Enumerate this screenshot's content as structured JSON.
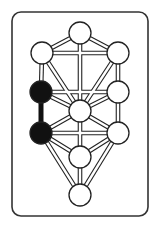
{
  "diagram": {
    "frame": {
      "x": 12,
      "y": 12,
      "w": 136,
      "h": 204,
      "rx": 9,
      "stroke": "#333333"
    },
    "colors": {
      "line": "#222222",
      "fill_empty": "#ffffff",
      "fill_highlight": "#111111",
      "background": "#ffffff"
    },
    "node_radius": 11,
    "nodes": [
      {
        "id": "n1",
        "x": 80,
        "y": 33,
        "highlighted": false
      },
      {
        "id": "n2",
        "x": 118,
        "y": 53,
        "highlighted": false
      },
      {
        "id": "n3",
        "x": 42,
        "y": 53,
        "highlighted": false
      },
      {
        "id": "n4",
        "x": 118,
        "y": 92,
        "highlighted": false
      },
      {
        "id": "n5",
        "x": 41,
        "y": 92,
        "highlighted": true
      },
      {
        "id": "n6",
        "x": 80,
        "y": 111,
        "highlighted": false
      },
      {
        "id": "n7",
        "x": 118,
        "y": 133,
        "highlighted": false
      },
      {
        "id": "n8",
        "x": 41,
        "y": 133,
        "highlighted": true
      },
      {
        "id": "n9",
        "x": 80,
        "y": 157,
        "highlighted": false
      },
      {
        "id": "n10",
        "x": 80,
        "y": 195,
        "highlighted": false
      }
    ],
    "paths": [
      {
        "from": "n1",
        "to": "n2",
        "highlighted": false
      },
      {
        "from": "n1",
        "to": "n3",
        "highlighted": false
      },
      {
        "from": "n1",
        "to": "n6",
        "highlighted": false
      },
      {
        "from": "n2",
        "to": "n3",
        "highlighted": false
      },
      {
        "from": "n2",
        "to": "n4",
        "highlighted": false
      },
      {
        "from": "n2",
        "to": "n6",
        "highlighted": false
      },
      {
        "from": "n3",
        "to": "n5",
        "highlighted": false
      },
      {
        "from": "n3",
        "to": "n6",
        "highlighted": false
      },
      {
        "from": "n4",
        "to": "n5",
        "highlighted": false
      },
      {
        "from": "n4",
        "to": "n6",
        "highlighted": false
      },
      {
        "from": "n4",
        "to": "n7",
        "highlighted": false
      },
      {
        "from": "n5",
        "to": "n6",
        "highlighted": false
      },
      {
        "from": "n5",
        "to": "n8",
        "highlighted": true
      },
      {
        "from": "n6",
        "to": "n7",
        "highlighted": false
      },
      {
        "from": "n6",
        "to": "n8",
        "highlighted": false
      },
      {
        "from": "n6",
        "to": "n9",
        "highlighted": false
      },
      {
        "from": "n7",
        "to": "n8",
        "highlighted": false
      },
      {
        "from": "n7",
        "to": "n9",
        "highlighted": false
      },
      {
        "from": "n7",
        "to": "n10",
        "highlighted": false
      },
      {
        "from": "n8",
        "to": "n9",
        "highlighted": false
      },
      {
        "from": "n8",
        "to": "n10",
        "highlighted": false
      },
      {
        "from": "n9",
        "to": "n10",
        "highlighted": false
      }
    ]
  }
}
